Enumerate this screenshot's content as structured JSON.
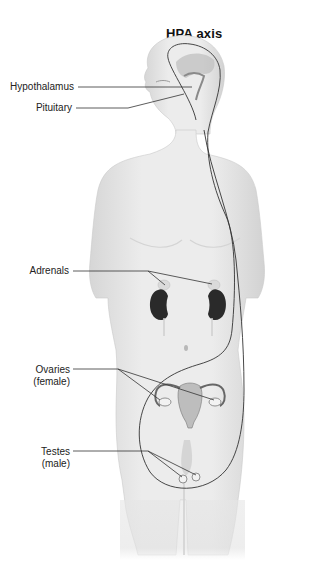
{
  "title": "HPA axis",
  "labels": {
    "hypothalamus": "Hypothalamus",
    "pituitary": "Pituitary",
    "adrenals": "Adrenals",
    "ovaries_line1": "Ovaries",
    "ovaries_line2": "(female)",
    "testes_line1": "Testes",
    "testes_line2": "(male)"
  },
  "colors": {
    "skin": "#e9e9e9",
    "skin_shadow": "#cfcfcf",
    "axis_line": "#333333",
    "kidney": "#2a2a2a",
    "adrenal": "#d8d8d8"
  }
}
